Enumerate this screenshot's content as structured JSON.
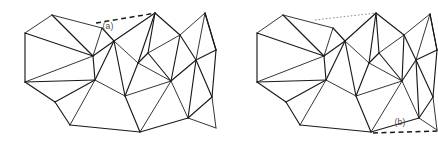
{
  "figure": {
    "type": "line-art-diagram",
    "background_color": "#ffffff",
    "line_color": "#1a1a1a",
    "label_color": "#4a4a4a",
    "width": 438,
    "height": 144,
    "panels": [
      {
        "id": "panel-a",
        "label": "(a)",
        "label_x": 108,
        "label_y": 29,
        "leader": {
          "style": "dashed",
          "color": "#1a1a1a",
          "x1": 96,
          "y1": 23,
          "x2": 156,
          "y2": 13
        },
        "vertices": [
          [
            25,
            33
          ],
          [
            25,
            82
          ],
          [
            52,
            15
          ],
          [
            55,
            102
          ],
          [
            70,
            125
          ],
          [
            93,
            56
          ],
          [
            95,
            80
          ],
          [
            102,
            28
          ],
          [
            140,
            132
          ],
          [
            114,
            41
          ],
          [
            125,
            96
          ],
          [
            138,
            63
          ],
          [
            155,
            13
          ],
          [
            148,
            53
          ],
          [
            171,
            81
          ],
          [
            180,
            35
          ],
          [
            188,
            118
          ],
          [
            196,
            60
          ],
          [
            205,
            13
          ],
          [
            212,
            97
          ],
          [
            216,
            50
          ],
          [
            216,
            128
          ]
        ],
        "edges": [
          [
            0,
            1
          ],
          [
            0,
            2
          ],
          [
            0,
            5
          ],
          [
            1,
            3
          ],
          [
            1,
            5
          ],
          [
            1,
            6
          ],
          [
            2,
            5
          ],
          [
            2,
            7
          ],
          [
            3,
            4
          ],
          [
            3,
            6
          ],
          [
            4,
            6
          ],
          [
            4,
            8
          ],
          [
            5,
            6
          ],
          [
            5,
            7
          ],
          [
            5,
            9
          ],
          [
            6,
            9
          ],
          [
            6,
            10
          ],
          [
            7,
            9
          ],
          [
            8,
            10
          ],
          [
            8,
            14
          ],
          [
            8,
            16
          ],
          [
            9,
            10
          ],
          [
            9,
            11
          ],
          [
            9,
            12
          ],
          [
            10,
            11
          ],
          [
            10,
            14
          ],
          [
            11,
            12
          ],
          [
            11,
            13
          ],
          [
            11,
            14
          ],
          [
            12,
            13
          ],
          [
            12,
            15
          ],
          [
            13,
            15
          ],
          [
            13,
            14
          ],
          [
            14,
            15
          ],
          [
            14,
            16
          ],
          [
            14,
            17
          ],
          [
            15,
            17
          ],
          [
            15,
            18
          ],
          [
            16,
            17
          ],
          [
            16,
            19
          ],
          [
            16,
            21
          ],
          [
            17,
            19
          ],
          [
            17,
            20
          ],
          [
            17,
            18
          ],
          [
            18,
            20
          ],
          [
            19,
            20
          ],
          [
            19,
            21
          ],
          [
            20,
            18
          ]
        ]
      },
      {
        "id": "panel-b",
        "label": "(b)",
        "label_x": 400,
        "label_y": 125,
        "leader": {
          "style": "dashed",
          "color": "#1a1a1a",
          "x1": 373,
          "y1": 133,
          "x2": 438,
          "y2": 131
        },
        "leader_secondary": {
          "style": "dotted",
          "color": "#8d8d8d",
          "x1": 315,
          "y1": 20,
          "x2": 376,
          "y2": 13
        },
        "vertices": [
          [
            257,
            33
          ],
          [
            257,
            82
          ],
          [
            283,
            15
          ],
          [
            286,
            102
          ],
          [
            300,
            125
          ],
          [
            324,
            56
          ],
          [
            326,
            80
          ],
          [
            333,
            28
          ],
          [
            371,
            132
          ],
          [
            345,
            41
          ],
          [
            356,
            96
          ],
          [
            369,
            63
          ],
          [
            376,
            13
          ],
          [
            379,
            53
          ],
          [
            402,
            81
          ],
          [
            404,
            35
          ],
          [
            419,
            118
          ],
          [
            416,
            60
          ],
          [
            430,
            14
          ],
          [
            433,
            97
          ],
          [
            437,
            50
          ],
          [
            437,
            130
          ]
        ],
        "edges": [
          [
            0,
            1
          ],
          [
            0,
            2
          ],
          [
            0,
            5
          ],
          [
            1,
            3
          ],
          [
            1,
            5
          ],
          [
            1,
            6
          ],
          [
            2,
            5
          ],
          [
            2,
            7
          ],
          [
            3,
            4
          ],
          [
            3,
            6
          ],
          [
            4,
            6
          ],
          [
            4,
            8
          ],
          [
            5,
            6
          ],
          [
            5,
            7
          ],
          [
            5,
            9
          ],
          [
            6,
            9
          ],
          [
            6,
            10
          ],
          [
            7,
            9
          ],
          [
            8,
            10
          ],
          [
            8,
            14
          ],
          [
            8,
            16
          ],
          [
            9,
            10
          ],
          [
            9,
            11
          ],
          [
            9,
            12
          ],
          [
            10,
            11
          ],
          [
            10,
            14
          ],
          [
            11,
            12
          ],
          [
            11,
            13
          ],
          [
            11,
            14
          ],
          [
            12,
            13
          ],
          [
            12,
            15
          ],
          [
            13,
            15
          ],
          [
            13,
            14
          ],
          [
            14,
            15
          ],
          [
            14,
            16
          ],
          [
            14,
            17
          ],
          [
            15,
            17
          ],
          [
            15,
            18
          ],
          [
            16,
            17
          ],
          [
            16,
            19
          ],
          [
            16,
            21
          ],
          [
            17,
            19
          ],
          [
            17,
            20
          ],
          [
            17,
            18
          ],
          [
            18,
            20
          ],
          [
            19,
            20
          ],
          [
            19,
            21
          ],
          [
            20,
            18
          ]
        ]
      }
    ]
  }
}
